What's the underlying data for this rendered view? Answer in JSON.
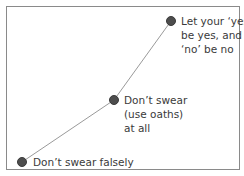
{
  "diagram": {
    "points": [
      {
        "label": "Don’t swear falsely",
        "x": 22,
        "y": 162
      },
      {
        "label": "Don’t swear\n(use oaths)\nat all",
        "x": 114,
        "y": 100
      },
      {
        "label": "Let your ‘yes’\nbe yes, and\n‘no’ be no",
        "x": 171,
        "y": 21
      }
    ],
    "colors": {
      "dot": "#4d4d4d",
      "line": "#9a9a9a",
      "border": "#8a8a8a",
      "text": "#3a3a3a"
    }
  }
}
